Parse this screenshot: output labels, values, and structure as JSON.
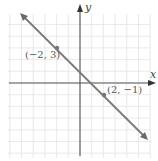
{
  "chart_data": {
    "type": "line",
    "title": "",
    "xlabel": "x",
    "ylabel": "y",
    "xlim": [
      -7,
      6
    ],
    "ylim": [
      -6,
      7
    ],
    "grid": true,
    "series": [
      {
        "name": "line through (-2, 3) and (2, -1)",
        "equation": "y = -x + 1",
        "x": [
          -2,
          2
        ],
        "y": [
          3,
          -1
        ]
      }
    ],
    "annotations": [
      {
        "text": "(−2, 3)",
        "x": -2,
        "y": 3
      },
      {
        "text": "(2, −1)",
        "x": 2,
        "y": -1
      }
    ]
  },
  "labels": {
    "x_axis": "x",
    "y_axis": "y",
    "point_a": "(−2, 3)",
    "point_b": "(2, −1)"
  },
  "colors": {
    "line": "#7a7a7a",
    "axis": "#555555",
    "grid": "#e2e2e2",
    "point": "#777777"
  }
}
